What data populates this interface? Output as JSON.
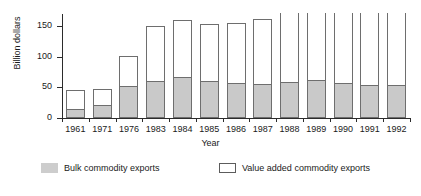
{
  "chart_data": {
    "type": "bar",
    "subtype": "stacked-vertical",
    "title": "",
    "xlabel": "Year",
    "ylabel": "Billion dollars",
    "ylim": [
      0,
      170
    ],
    "yticks": [
      0,
      50,
      100,
      150
    ],
    "ytick_labels": [
      "0",
      "50",
      "100",
      "150"
    ],
    "grid": false,
    "legend_position": "bottom",
    "note": "Bars for 1988-1992 are clipped by the top edge of the plot; their totals exceed the visible axis range.",
    "categories": [
      "1961",
      "1971",
      "1976",
      "1983",
      "1984",
      "1985",
      "1986",
      "1987",
      "1988",
      "1989",
      "1990",
      "1991",
      "1992"
    ],
    "series": [
      {
        "name": "Bulk commodity exports",
        "color": "#c9c9c9",
        "values": [
          15,
          22,
          52,
          60,
          67,
          61,
          57,
          55,
          59,
          62,
          57,
          54,
          54
        ]
      },
      {
        "name": "Value added commodity exports",
        "color": "#ffffff",
        "values": [
          30,
          26,
          49,
          91,
          94,
          92,
          99,
          107,
          111,
          108,
          113,
          116,
          116
        ]
      }
    ],
    "totals": [
      45,
      48,
      101,
      151,
      161,
      153,
      156,
      162,
      170,
      170,
      170,
      170,
      170
    ],
    "totals_clipped": [
      false,
      false,
      false,
      false,
      false,
      false,
      false,
      false,
      true,
      true,
      true,
      true,
      true
    ]
  },
  "axes": {
    "y_title": "Billion dollars",
    "x_title": "Year"
  },
  "legend": {
    "items": [
      {
        "label": "Bulk commodity exports",
        "swatch": "filled-gray-swatch"
      },
      {
        "label": "Value added commodity exports",
        "swatch": "outlined-white-swatch"
      }
    ]
  },
  "colors": {
    "bulk_fill": "#c9c9c9",
    "value_fill": "#ffffff",
    "outline": "#6e6e6e",
    "axis": "#2b2b2b",
    "text": "#1a1a1a",
    "background": "#ffffff"
  }
}
